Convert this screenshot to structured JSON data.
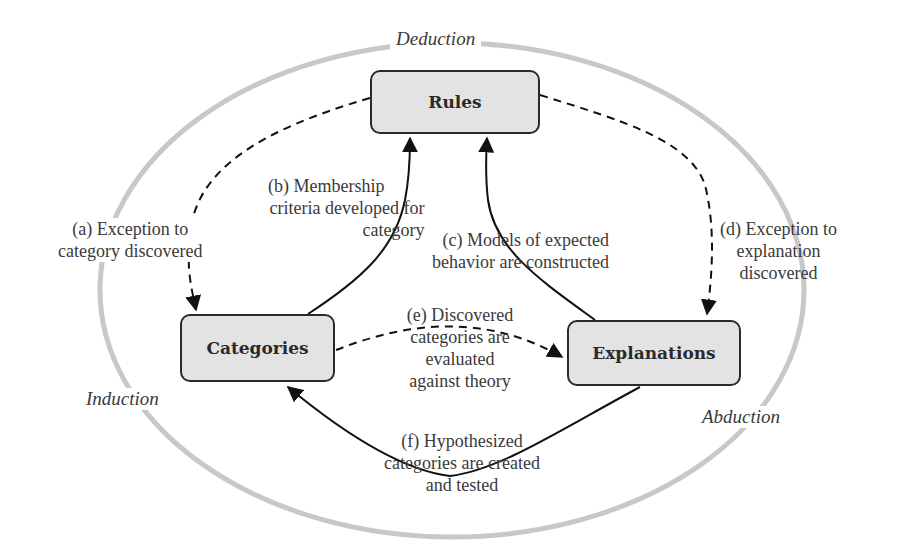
{
  "diagram": {
    "modes": {
      "deduction": "Deduction",
      "induction": "Induction",
      "abduction": "Abduction"
    },
    "nodes": {
      "rules": "Rules",
      "categories": "Categories",
      "explanations": "Explanations"
    },
    "edges": {
      "a": {
        "from": "Rules",
        "to": "Categories",
        "style": "dashed",
        "lines": [
          "(a) Exception to",
          "category discovered"
        ]
      },
      "b": {
        "from": "Categories",
        "to": "Rules",
        "style": "solid",
        "lines": [
          "(b) Membership",
          "criteria developed for",
          "category"
        ]
      },
      "c": {
        "from": "Explanations",
        "to": "Rules",
        "style": "solid",
        "lines": [
          "(c) Models of expected",
          "behavior are constructed"
        ]
      },
      "d": {
        "from": "Rules",
        "to": "Explanations",
        "style": "dashed",
        "lines": [
          "(d) Exception to",
          "explanation",
          "discovered"
        ]
      },
      "e": {
        "from": "Categories",
        "to": "Explanations",
        "style": "dashed",
        "lines": [
          "(e) Discovered",
          "categories are",
          "evaluated",
          "against theory"
        ]
      },
      "f": {
        "from": "Explanations",
        "to": "Categories",
        "style": "solid",
        "lines": [
          "(f) Hypothesized",
          "categories are created",
          "and tested"
        ]
      }
    },
    "colors": {
      "node_fill": "#e3e3e3",
      "node_stroke": "#2a2a2a",
      "ellipse": "#c8c8c8",
      "text": "#3a3a3a"
    }
  }
}
